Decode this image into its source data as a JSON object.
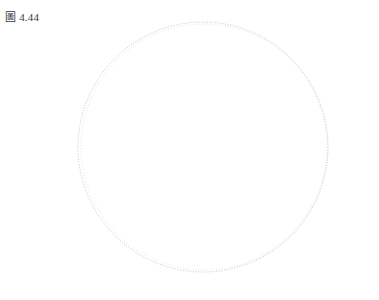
{
  "figure": {
    "label": "圖 4.44",
    "caption_prefix": "圖",
    "number": "4.44"
  },
  "canvas": {
    "width": 379,
    "height": 300,
    "background": "#ffffff"
  },
  "colors": {
    "axis": "#555555",
    "sphere_outline": "#b9b9b9",
    "ellipse_arc": "#a8a8a8",
    "ellipse_arc_faint": "#c2c2c2",
    "ray_dots": "#111111",
    "point_fill": "#000000",
    "label_text": "#1a1a1a",
    "figure_label_text": "#3a3a3a"
  },
  "geometry": {
    "center": {
      "x": 203,
      "y": 147
    },
    "sphere_radius": 125,
    "inner_circle_radius": 15,
    "vertical_axis": {
      "x": 203,
      "y_top": 97,
      "y_bottom": 197
    },
    "horizontal_axis": {
      "y": 147,
      "x_left": 48,
      "x_right": 358
    },
    "focus_left": {
      "x": 118,
      "y": 147
    },
    "focus_right": {
      "x": 292,
      "y": 147
    },
    "point_a": {
      "x": 172,
      "y": 85
    },
    "point_a_radius": 4,
    "tick_half_height": 6,
    "tick_positions_x": [
      118,
      140,
      159,
      178,
      203,
      228,
      247,
      266,
      292
    ],
    "ellipse_semi_major_axes": [
      92,
      102,
      114,
      126,
      139
    ],
    "ellipse_focal_distance": 87
  },
  "labels": {
    "point_a": {
      "text": "A",
      "x": 166,
      "y": 75
    },
    "focus_left": {
      "base": "F",
      "sub": "1",
      "x": 110,
      "y": 163
    },
    "focus_right": {
      "base": "F",
      "sub": "2",
      "x": 288,
      "y": 163
    }
  },
  "rays": {
    "dot_radius": 1.7,
    "dot_spacing": 6,
    "segments": [
      {
        "name": "focus-left-to-a",
        "from": "focus_left",
        "to": "point_a"
      },
      {
        "name": "a-to-focus-right",
        "from": "point_a",
        "to": "focus_right"
      }
    ]
  }
}
